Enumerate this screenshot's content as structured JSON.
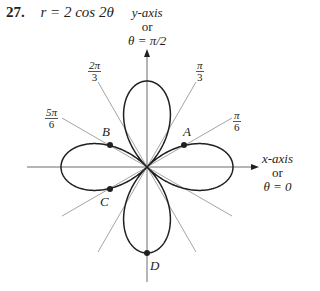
{
  "problem": {
    "number": "27.",
    "equation": "r = 2 cos 2θ"
  },
  "axes": {
    "y_label": [
      "y-axis",
      "or",
      "θ = π/2"
    ],
    "x_label": [
      "x-axis",
      "or",
      "θ = 0"
    ]
  },
  "angle_labels": [
    {
      "num": "2π",
      "den": "3"
    },
    {
      "num": "π",
      "den": "3"
    },
    {
      "num": "5π",
      "den": "6"
    },
    {
      "num": "π",
      "den": "6"
    }
  ],
  "points": [
    "A",
    "B",
    "C",
    "D"
  ],
  "chart_data": {
    "type": "polar-curve",
    "title": "r = 2 cos 2θ",
    "curve": "four-leaved rose",
    "rmax": 2,
    "reference_rays_deg": [
      30,
      60,
      120,
      150
    ],
    "ray_labels": [
      "π/6",
      "π/3",
      "2π/3",
      "5π/6"
    ],
    "axis_labels": {
      "x": "x-axis or θ = 0",
      "y": "y-axis or θ = π/2"
    },
    "marked_points": [
      {
        "label": "A",
        "theta": "π/6",
        "r": 1
      },
      {
        "label": "B",
        "theta": "5π/6",
        "r": 1
      },
      {
        "label": "C",
        "theta": "7π/6",
        "r": 1
      },
      {
        "label": "D",
        "theta": "3π/2",
        "r": 2
      }
    ]
  }
}
